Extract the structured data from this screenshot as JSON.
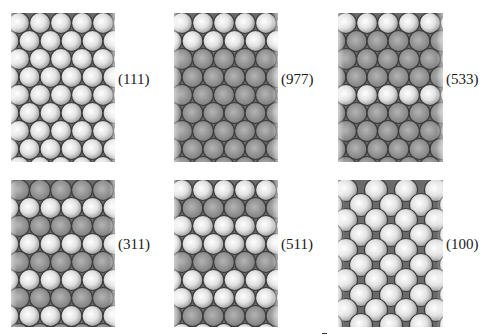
{
  "figure": {
    "background": "#ffffff",
    "colors": {
      "gap": "#6a6a6a",
      "outline": "#3c3c3c",
      "light_center": "#ffffff",
      "light_edge": "#9a9a9a",
      "dark_center": "#b4b4b4",
      "dark_edge": "#7a7a7a"
    },
    "panels": [
      {
        "id": "111",
        "label": "(111)",
        "box": {
          "x": 11,
          "y": 13,
          "w": 104,
          "h": 149
        },
        "label_pos": {
          "x": 118,
          "y": 80
        },
        "lattice": "hex",
        "spacing_x": 21,
        "spacing_y": 18,
        "radius": 10.5,
        "rows": [
          "L",
          "L",
          "L",
          "L",
          "L",
          "L",
          "L",
          "L",
          "L"
        ]
      },
      {
        "id": "977",
        "label": "(977)",
        "box": {
          "x": 174,
          "y": 13,
          "w": 104,
          "h": 149
        },
        "label_pos": {
          "x": 281,
          "y": 80
        },
        "lattice": "hex",
        "spacing_x": 21,
        "spacing_y": 18,
        "radius": 10.5,
        "rows": [
          "L",
          "L",
          "D",
          "D",
          "D",
          "D",
          "D",
          "D",
          "D"
        ]
      },
      {
        "id": "533",
        "label": "(533)",
        "box": {
          "x": 338,
          "y": 13,
          "w": 105,
          "h": 149
        },
        "label_pos": {
          "x": 446,
          "y": 80
        },
        "lattice": "hex",
        "spacing_x": 21,
        "spacing_y": 18,
        "radius": 10.5,
        "rows": [
          "L",
          "D",
          "D",
          "D",
          "L",
          "D",
          "D",
          "D",
          "D"
        ]
      },
      {
        "id": "311",
        "label": "(311)",
        "box": {
          "x": 11,
          "y": 180,
          "w": 104,
          "h": 147
        },
        "label_pos": {
          "x": 118,
          "y": 245
        },
        "lattice": "hex",
        "spacing_x": 21,
        "spacing_y": 18,
        "radius": 10.5,
        "rows": [
          "D",
          "L",
          "D",
          "L",
          "D",
          "L",
          "D",
          "L",
          "D"
        ]
      },
      {
        "id": "511",
        "label": "(511)",
        "box": {
          "x": 174,
          "y": 180,
          "w": 104,
          "h": 147
        },
        "label_pos": {
          "x": 281,
          "y": 245
        },
        "lattice": "hex",
        "spacing_x": 21,
        "spacing_y": 18,
        "radius": 10.5,
        "rows": [
          "L",
          "D",
          "L",
          "L",
          "D",
          "L",
          "L",
          "D",
          "L"
        ]
      },
      {
        "id": "100",
        "label": "(100)",
        "box": {
          "x": 338,
          "y": 180,
          "w": 105,
          "h": 147
        },
        "label_pos": {
          "x": 446,
          "y": 245
        },
        "lattice": "square45",
        "spacing_x": 30,
        "spacing_y": 15,
        "radius": 11.5,
        "rows": [
          "L",
          "L",
          "L",
          "L",
          "L",
          "L",
          "L",
          "L",
          "L",
          "L",
          "L"
        ]
      }
    ]
  }
}
